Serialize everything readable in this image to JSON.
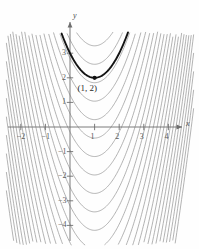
{
  "chart_data": {
    "type": "line",
    "title": "",
    "xlabel": "x",
    "ylabel": "y",
    "xlim": [
      -2.8,
      5.15
    ],
    "ylim": [
      -4.9,
      3.95
    ],
    "grid": false,
    "legend": false,
    "x_ticks": [
      -2,
      -1,
      1,
      2,
      3,
      4
    ],
    "x_tick_labels": [
      "−2",
      "−1",
      "1",
      "2",
      "3",
      "4"
    ],
    "y_ticks": [
      3,
      2,
      1,
      -1,
      -2,
      -3,
      -4
    ],
    "y_tick_labels": [
      "3",
      "2",
      "1",
      "−1",
      "−2",
      "−3",
      "−4"
    ],
    "annotation": "(1, 2)",
    "annotation_point": [
      1,
      2
    ],
    "vertex_x": 1,
    "leading_coefficient": 1,
    "highlighted_series": {
      "name": "y = (x-1)^2 + 2",
      "C": 2,
      "color": "#141414",
      "width": 1.9
    },
    "family_color": "#9a9a9a",
    "family_width": 0.75,
    "family_C": [
      3.3,
      2.55,
      1.8,
      1.05,
      0.3,
      -0.45,
      -1.2,
      -1.95,
      -2.7,
      -3.45,
      -4.2,
      -4.95,
      -5.7,
      -6.45,
      -7.2,
      -7.95,
      -8.7,
      -9.45,
      -10.2,
      -10.95,
      -11.7,
      -12.45,
      -13.2,
      -13.95,
      -14.7,
      -15.45
    ]
  },
  "axes": {
    "x_axis_label": "x",
    "y_axis_label": "y",
    "origin": [
      0,
      0
    ]
  },
  "colors": {
    "background": "#fefefe",
    "axis": "#6e6e6e",
    "tick_text": "#5a5a5a",
    "curve_family": "#9a9a9a",
    "curve_highlight": "#141414",
    "point": "#111111"
  }
}
